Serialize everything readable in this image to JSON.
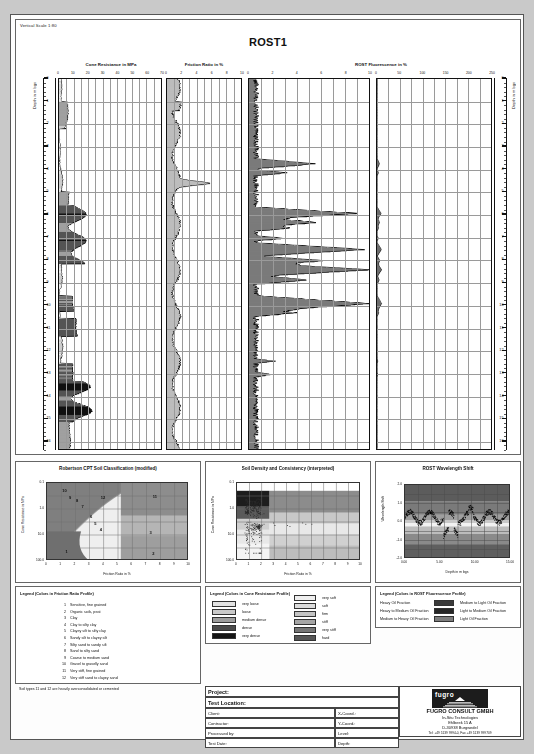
{
  "sheet": {
    "vertical_scale": "Vertical Scale 1:80",
    "title": "ROST1"
  },
  "log": {
    "depth_axis_label": "Depth in m bgs",
    "depth_ticks": [
      0,
      1,
      2,
      3,
      4,
      5,
      6,
      7,
      8,
      9,
      10,
      11,
      12,
      13,
      14,
      15,
      16
    ],
    "columns": [
      {
        "name": "cone-resistance",
        "title": "Cone Resistance in MPa",
        "ticks": [
          0,
          10,
          20,
          30,
          40,
          50,
          60,
          70
        ]
      },
      {
        "name": "friction-ratio",
        "title": "Friction Ratio in %",
        "ticks": [
          0,
          2,
          4,
          6,
          8,
          10
        ]
      },
      {
        "name": "rost-fluorescence-low",
        "title": "ROST Fluorescence in %",
        "ticks": [
          0,
          2,
          4,
          6,
          8,
          10
        ]
      },
      {
        "name": "rost-fluorescence-high",
        "title": "",
        "ticks": [
          0,
          50,
          100,
          150,
          200,
          250
        ]
      }
    ]
  },
  "chart_data": [
    {
      "type": "scatter",
      "name": "robertson-cpt-soil-classification",
      "title": "Robertson CPT Soil Classification (modified)",
      "xlabel": "Friction Ratio in %",
      "ylabel": "Cone Resistance in MPa",
      "xlim": [
        0,
        10
      ],
      "ylim": [
        0.1,
        100
      ],
      "yscale": "log",
      "xticks": [
        0,
        1,
        2,
        3,
        4,
        5,
        6,
        7,
        8,
        9,
        10
      ],
      "yticks": [
        "0.1",
        "1.0",
        "10.0",
        "100.0"
      ],
      "grid": true,
      "zone_labels": [
        {
          "n": "10",
          "x": 1.25,
          "y": 55
        },
        {
          "n": "9",
          "x": 1.65,
          "y": 27
        },
        {
          "n": "8",
          "x": 2.15,
          "y": 21
        },
        {
          "n": "7",
          "x": 2.55,
          "y": 12
        },
        {
          "n": "6",
          "x": 3.15,
          "y": 5.2
        },
        {
          "n": "5",
          "x": 3.45,
          "y": 2.6
        },
        {
          "n": "4",
          "x": 3.85,
          "y": 1.5
        },
        {
          "n": "12",
          "x": 4.0,
          "y": 28
        },
        {
          "n": "11",
          "x": 7.7,
          "y": 30
        },
        {
          "n": "3",
          "x": 7.4,
          "y": 1.2
        },
        {
          "n": "2",
          "x": 7.6,
          "y": 0.18
        },
        {
          "n": "1",
          "x": 1.4,
          "y": 0.2
        }
      ]
    },
    {
      "type": "scatter",
      "name": "soil-density-and-consistency",
      "title": "Soil Density and Consistency (interpreted)",
      "xlabel": "Friction Ratio in %",
      "ylabel": "Cone Resistance in MPa",
      "xlim": [
        0,
        10
      ],
      "ylim": [
        0.1,
        100
      ],
      "yscale": "log",
      "xticks": [
        0,
        1,
        2,
        3,
        4,
        5,
        6,
        7,
        8,
        9,
        10
      ],
      "yticks": [
        "0.1",
        "1.0",
        "10.0",
        "100.0"
      ],
      "grid": true
    },
    {
      "type": "scatter",
      "name": "rost-wavelength-shift",
      "title": "ROST Wavelength Shift",
      "xlabel": "Depth in m bgs",
      "ylabel": "Wavelength Shift",
      "xlim": [
        0,
        16
      ],
      "ylim": [
        -2.0,
        2.0
      ],
      "xticks": [
        "0.00",
        "5.00",
        "10.00",
        "15.00"
      ],
      "yticks": [
        "2.0",
        "1.0",
        "0.0",
        "-1.0",
        "-2.0"
      ],
      "grid": true
    }
  ],
  "legend_friction": {
    "title": "Legend (Colors in Friction Ratio Profile)",
    "items": [
      {
        "n": "1",
        "label": "Sensitive, fine grained"
      },
      {
        "n": "2",
        "label": "Organic soils, peat"
      },
      {
        "n": "3",
        "label": "Clay"
      },
      {
        "n": "4",
        "label": "Clay to silty clay"
      },
      {
        "n": "5",
        "label": "Clayey silt to silty clay"
      },
      {
        "n": "6",
        "label": "Sandy silt to clayey silt"
      },
      {
        "n": "7",
        "label": "Silty sand to sandy silt"
      },
      {
        "n": "8",
        "label": "Sand to silty sand"
      },
      {
        "n": "9",
        "label": "Coarse to medium sand"
      },
      {
        "n": "10",
        "label": "Gravel to gravelly sand"
      },
      {
        "n": "11",
        "label": "Very stiff, fine grained"
      },
      {
        "n": "12",
        "label": "Very stiff sand to clayey sand"
      }
    ],
    "note": "Soil types 11 and 12 are heavily overconsolidated or cemented"
  },
  "legend_cone": {
    "title": "Legend (Colors in Cone Resistance Profile)",
    "density": [
      {
        "label": "very loose",
        "color": "#e3e3e3"
      },
      {
        "label": "loose",
        "color": "#c9c9c9"
      },
      {
        "label": "medium dense",
        "color": "#9d9d9d"
      },
      {
        "label": "dense",
        "color": "#4a4a4a"
      },
      {
        "label": "very dense",
        "color": "#141414"
      }
    ],
    "consistency": [
      {
        "label": "very soft",
        "color": "#efefef"
      },
      {
        "label": "soft",
        "color": "#dcdcdc"
      },
      {
        "label": "firm",
        "color": "#c4c4c4"
      },
      {
        "label": "stiff",
        "color": "#a6a6a6"
      },
      {
        "label": "very stiff",
        "color": "#767676"
      },
      {
        "label": "hard",
        "color": "#565656"
      }
    ]
  },
  "legend_rost": {
    "title": "Legend (Colors in ROST Fluorescence Profile)",
    "left": [
      {
        "label": "Heavy Oil Fraction",
        "color": "#3a3a3a"
      },
      {
        "label": "Heavy to Medium Oil Fraction",
        "color": "#262626"
      },
      {
        "label": "Medium to Heavy Oil Fraction",
        "color": "#7d7d7d"
      }
    ],
    "right": [
      {
        "label": "Medium to Light Oil Fraction",
        "color": "#d8d8d8"
      },
      {
        "label": "Light to Medium Oil Fraction",
        "color": "#5e5e5e"
      },
      {
        "label": "Light Oil Fraction",
        "color": "#111111"
      }
    ]
  },
  "titleblock": {
    "project": "Project:",
    "test_location": "Test Location:",
    "client": "Client:",
    "contractor": "Contractor:",
    "processed_by": "Processed by:",
    "test_date": "Test Date:",
    "x_coord": "X-Coord.:",
    "y_coord": "Y-Coord.:",
    "level": "Level:",
    "depth": "Depth:"
  },
  "company": {
    "logo_text": "fugro",
    "name": "FUGRO CONSULT GMBH",
    "line1": "In-Situ Technologies",
    "line2": "Ehlbeek 15 A",
    "line3": "D-30938 Burgwedel",
    "line4": "Tel: +49 5139 9994-0, Fax +49 5139 999709"
  }
}
